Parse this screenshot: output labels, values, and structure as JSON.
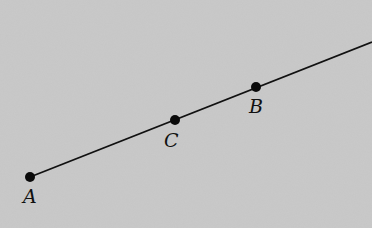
{
  "figure": {
    "background_color": "#c9c9c9",
    "line_color": "#111111",
    "line": {
      "start": {
        "x": 30,
        "y": 177
      },
      "end": {
        "x": 372,
        "y": 42
      }
    },
    "points": [
      {
        "label": "A",
        "x": 30,
        "y": 177,
        "label_x": 23,
        "label_y": 203
      },
      {
        "label": "C",
        "x": 175,
        "y": 120,
        "label_x": 164,
        "label_y": 147
      },
      {
        "label": "B",
        "x": 256,
        "y": 87,
        "label_x": 249,
        "label_y": 113
      }
    ]
  }
}
